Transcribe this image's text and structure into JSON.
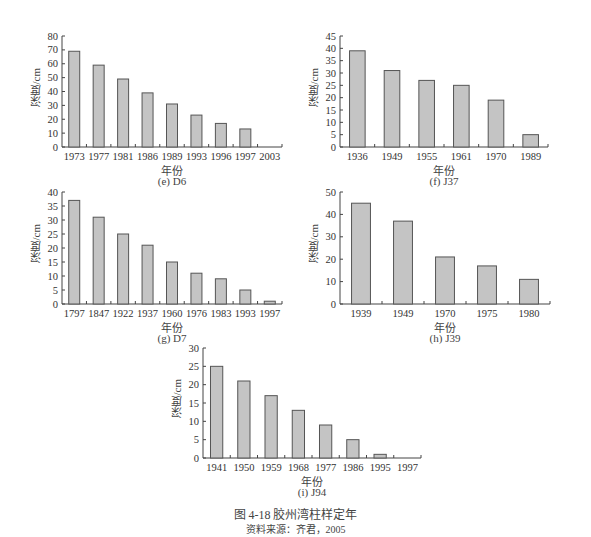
{
  "chart_data": [
    {
      "id": "e",
      "type": "bar",
      "title": "(e) D6",
      "xlabel": "年份",
      "ylabel": "深度/cm",
      "categories": [
        "1973",
        "1977",
        "1981",
        "1986",
        "1989",
        "1993",
        "1996",
        "1997",
        "2003"
      ],
      "values": [
        69,
        59,
        49,
        39,
        31,
        23,
        17,
        13,
        0
      ],
      "yticks": [
        0,
        10,
        20,
        30,
        40,
        50,
        60,
        70,
        80
      ],
      "ylim": [
        0,
        80
      ],
      "grid": false,
      "bar_color": "#c4c4c4"
    },
    {
      "id": "f",
      "type": "bar",
      "title": "(f) J37",
      "xlabel": "年份",
      "ylabel": "深度/cm",
      "categories": [
        "1936",
        "1949",
        "1955",
        "1961",
        "1970",
        "1989"
      ],
      "values": [
        39,
        31,
        27,
        25,
        19,
        5
      ],
      "yticks": [
        0,
        5,
        10,
        15,
        20,
        25,
        30,
        35,
        40,
        45
      ],
      "ylim": [
        0,
        45
      ],
      "grid": false,
      "bar_color": "#c4c4c4"
    },
    {
      "id": "g",
      "type": "bar",
      "title": "(g) D7",
      "xlabel": "年份",
      "ylabel": "深度/cm",
      "categories": [
        "1797",
        "1847",
        "1922",
        "1937",
        "1960",
        "1976",
        "1983",
        "1993",
        "1997"
      ],
      "values": [
        37,
        31,
        25,
        21,
        15,
        11,
        9,
        5,
        1
      ],
      "yticks": [
        0,
        5,
        10,
        15,
        20,
        25,
        30,
        35,
        40
      ],
      "ylim": [
        0,
        40
      ],
      "grid": false,
      "bar_color": "#c4c4c4"
    },
    {
      "id": "h",
      "type": "bar",
      "title": "(h) J39",
      "xlabel": "年份",
      "ylabel": "深度/cm",
      "categories": [
        "1939",
        "1949",
        "1970",
        "1975",
        "1980"
      ],
      "values": [
        45,
        37,
        21,
        17,
        11
      ],
      "yticks": [
        0,
        10,
        20,
        30,
        40,
        50
      ],
      "ylim": [
        0,
        50
      ],
      "grid": false,
      "bar_color": "#c4c4c4"
    },
    {
      "id": "i",
      "type": "bar",
      "title": "(i) J94",
      "xlabel": "年份",
      "ylabel": "深度/cm",
      "categories": [
        "1941",
        "1950",
        "1959",
        "1968",
        "1977",
        "1986",
        "1995",
        "1997"
      ],
      "values": [
        25,
        21,
        17,
        13,
        9,
        5,
        1,
        0
      ],
      "yticks": [
        0,
        5,
        10,
        15,
        20,
        25,
        30
      ],
      "ylim": [
        0,
        30
      ],
      "grid": false,
      "bar_color": "#c4c4c4"
    }
  ],
  "caption": {
    "title": "图 4-18    胶州湾柱样定年",
    "source": "资料来源：齐君，2005"
  },
  "layout": [
    {
      "left": 62,
      "top": 36,
      "width": 220,
      "height": 111
    },
    {
      "left": 340,
      "top": 36,
      "width": 208,
      "height": 111
    },
    {
      "left": 62,
      "top": 192,
      "width": 220,
      "height": 112
    },
    {
      "left": 340,
      "top": 192,
      "width": 210,
      "height": 112
    },
    {
      "left": 203,
      "top": 348,
      "width": 218,
      "height": 110
    }
  ]
}
